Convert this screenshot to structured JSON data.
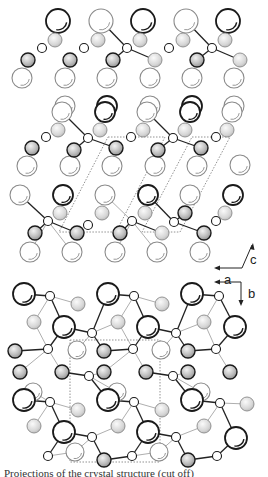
{
  "figure": {
    "caption_partial": "Projections of the crystal structure (cut off)",
    "colors": {
      "stroke_dark": "#1a1a1a",
      "stroke_light": "#8a8a8a",
      "bond_dark": "#222222",
      "bond_light": "#999999",
      "cell_dash": "#777777",
      "shade": "#bdbdbd"
    }
  },
  "axes_top": {
    "c_label": "c",
    "a_label": "a"
  },
  "axes_bottom": {
    "a_label": "a",
    "b_label": "b"
  },
  "atoms": [
    {
      "x": 58,
      "y": 21,
      "r": 12,
      "t": "Ld"
    },
    {
      "x": 101,
      "y": 21,
      "r": 12,
      "t": "Ll"
    },
    {
      "x": 143,
      "y": 21,
      "r": 12,
      "t": "Ld"
    },
    {
      "x": 186,
      "y": 21,
      "r": 12,
      "t": "Ll"
    },
    {
      "x": 228,
      "y": 21,
      "r": 12,
      "t": "Ld"
    },
    {
      "x": 55,
      "y": 40,
      "r": 7,
      "t": "Ms"
    },
    {
      "x": 98,
      "y": 40,
      "r": 7,
      "t": "Ms"
    },
    {
      "x": 140,
      "y": 40,
      "r": 7,
      "t": "Ms"
    },
    {
      "x": 183,
      "y": 40,
      "r": 7,
      "t": "Ms"
    },
    {
      "x": 225,
      "y": 40,
      "r": 7,
      "t": "Ms"
    },
    {
      "x": 42,
      "y": 48,
      "r": 4.5,
      "t": "S"
    },
    {
      "x": 84,
      "y": 48,
      "r": 4.5,
      "t": "S"
    },
    {
      "x": 127,
      "y": 48,
      "r": 4.5,
      "t": "S"
    },
    {
      "x": 169,
      "y": 48,
      "r": 4.5,
      "t": "S"
    },
    {
      "x": 212,
      "y": 48,
      "r": 4.5,
      "t": "S"
    },
    {
      "x": 28,
      "y": 60,
      "r": 7,
      "t": "Md"
    },
    {
      "x": 70,
      "y": 60,
      "r": 7,
      "t": "Md"
    },
    {
      "x": 113,
      "y": 60,
      "r": 7,
      "t": "Md"
    },
    {
      "x": 155,
      "y": 60,
      "r": 7,
      "t": "Ms"
    },
    {
      "x": 197,
      "y": 60,
      "r": 7,
      "t": "Md"
    },
    {
      "x": 240,
      "y": 60,
      "r": 7,
      "t": "Ms"
    },
    {
      "x": 22,
      "y": 78,
      "r": 10,
      "t": "Ll"
    },
    {
      "x": 65,
      "y": 78,
      "r": 10,
      "t": "Ll"
    },
    {
      "x": 107,
      "y": 78,
      "r": 10,
      "t": "Ll"
    },
    {
      "x": 150,
      "y": 78,
      "r": 10,
      "t": "Ll"
    },
    {
      "x": 192,
      "y": 78,
      "r": 10,
      "t": "Ll"
    },
    {
      "x": 234,
      "y": 78,
      "r": 10,
      "t": "Ll"
    },
    {
      "x": 65,
      "y": 106,
      "r": 10,
      "t": "Ll"
    },
    {
      "x": 107,
      "y": 106,
      "r": 10,
      "t": "Ld"
    },
    {
      "x": 150,
      "y": 106,
      "r": 10,
      "t": "Ll"
    },
    {
      "x": 192,
      "y": 106,
      "r": 10,
      "t": "Ld"
    },
    {
      "x": 234,
      "y": 106,
      "r": 10,
      "t": "Ll"
    },
    {
      "x": 62,
      "y": 112,
      "r": 10,
      "t": "Ll"
    },
    {
      "x": 105,
      "y": 112,
      "r": 10,
      "t": "Ld"
    },
    {
      "x": 147,
      "y": 112,
      "r": 10,
      "t": "Ll"
    },
    {
      "x": 190,
      "y": 112,
      "r": 10,
      "t": "Ld"
    },
    {
      "x": 232,
      "y": 112,
      "r": 10,
      "t": "Ll"
    },
    {
      "x": 58,
      "y": 130,
      "r": 7,
      "t": "Ms"
    },
    {
      "x": 100,
      "y": 130,
      "r": 7,
      "t": "Ms"
    },
    {
      "x": 143,
      "y": 130,
      "r": 7,
      "t": "Ms"
    },
    {
      "x": 185,
      "y": 130,
      "r": 7,
      "t": "Ms"
    },
    {
      "x": 227,
      "y": 130,
      "r": 7,
      "t": "Ms"
    },
    {
      "x": 46,
      "y": 137,
      "r": 4.5,
      "t": "S"
    },
    {
      "x": 88,
      "y": 138,
      "r": 4.5,
      "t": "S"
    },
    {
      "x": 131,
      "y": 137,
      "r": 4.5,
      "t": "S"
    },
    {
      "x": 173,
      "y": 138,
      "r": 4.5,
      "t": "S"
    },
    {
      "x": 216,
      "y": 137,
      "r": 4.5,
      "t": "S"
    },
    {
      "x": 32,
      "y": 148,
      "r": 7,
      "t": "Md"
    },
    {
      "x": 74,
      "y": 150,
      "r": 7,
      "t": "Md"
    },
    {
      "x": 116,
      "y": 148,
      "r": 7,
      "t": "Md"
    },
    {
      "x": 158,
      "y": 150,
      "r": 7,
      "t": "Md"
    },
    {
      "x": 201,
      "y": 148,
      "r": 7,
      "t": "Md"
    },
    {
      "x": 27,
      "y": 166,
      "r": 10,
      "t": "Ll"
    },
    {
      "x": 70,
      "y": 166,
      "r": 10,
      "t": "Ll"
    },
    {
      "x": 112,
      "y": 166,
      "r": 10,
      "t": "Ll"
    },
    {
      "x": 155,
      "y": 166,
      "r": 10,
      "t": "Ll"
    },
    {
      "x": 197,
      "y": 166,
      "r": 10,
      "t": "Ll"
    },
    {
      "x": 240,
      "y": 165,
      "r": 10,
      "t": "Ll"
    },
    {
      "x": 20,
      "y": 195,
      "r": 10,
      "t": "Ll"
    },
    {
      "x": 63,
      "y": 195,
      "r": 10,
      "t": "Ld"
    },
    {
      "x": 105,
      "y": 195,
      "r": 10,
      "t": "Ll"
    },
    {
      "x": 148,
      "y": 195,
      "r": 10,
      "t": "Ld"
    },
    {
      "x": 190,
      "y": 195,
      "r": 10,
      "t": "Ll"
    },
    {
      "x": 233,
      "y": 195,
      "r": 10,
      "t": "Ld"
    },
    {
      "x": 60,
      "y": 213,
      "r": 7,
      "t": "Ms"
    },
    {
      "x": 102,
      "y": 213,
      "r": 7,
      "t": "Ms"
    },
    {
      "x": 145,
      "y": 213,
      "r": 7,
      "t": "Ms"
    },
    {
      "x": 185,
      "y": 213,
      "r": 7,
      "t": "Md"
    },
    {
      "x": 225,
      "y": 213,
      "r": 7,
      "t": "Ms"
    },
    {
      "x": 48,
      "y": 221,
      "r": 4.5,
      "t": "S"
    },
    {
      "x": 88,
      "y": 225,
      "r": 4.5,
      "t": "S"
    },
    {
      "x": 132,
      "y": 221,
      "r": 4.5,
      "t": "S"
    },
    {
      "x": 174,
      "y": 222,
      "r": 4.5,
      "t": "S"
    },
    {
      "x": 216,
      "y": 221,
      "r": 4.5,
      "t": "S"
    },
    {
      "x": 35,
      "y": 233,
      "r": 7,
      "t": "Md"
    },
    {
      "x": 77,
      "y": 233,
      "r": 7,
      "t": "Md"
    },
    {
      "x": 120,
      "y": 233,
      "r": 7,
      "t": "Md"
    },
    {
      "x": 162,
      "y": 233,
      "r": 7,
      "t": "Ms"
    },
    {
      "x": 204,
      "y": 233,
      "r": 7,
      "t": "Md"
    },
    {
      "x": 30,
      "y": 252,
      "r": 10,
      "t": "Ll"
    },
    {
      "x": 72,
      "y": 252,
      "r": 10,
      "t": "Ll"
    },
    {
      "x": 115,
      "y": 252,
      "r": 10,
      "t": "Ll"
    },
    {
      "x": 157,
      "y": 252,
      "r": 10,
      "t": "Ll"
    },
    {
      "x": 200,
      "y": 252,
      "r": 10,
      "t": "Ll"
    },
    {
      "x": 24,
      "y": 294,
      "r": 11,
      "t": "Ld"
    },
    {
      "x": 108,
      "y": 294,
      "r": 11,
      "t": "Ld"
    },
    {
      "x": 192,
      "y": 294,
      "r": 11,
      "t": "Ld"
    },
    {
      "x": 50,
      "y": 296,
      "r": 4.5,
      "t": "S"
    },
    {
      "x": 134,
      "y": 296,
      "r": 4.5,
      "t": "S"
    },
    {
      "x": 219,
      "y": 296,
      "r": 4.5,
      "t": "S"
    },
    {
      "x": 78,
      "y": 304,
      "r": 7,
      "t": "Ms"
    },
    {
      "x": 162,
      "y": 304,
      "r": 7,
      "t": "Ms"
    },
    {
      "x": 34,
      "y": 322,
      "r": 7,
      "t": "Ms"
    },
    {
      "x": 118,
      "y": 322,
      "r": 7,
      "t": "Ms"
    },
    {
      "x": 204,
      "y": 322,
      "r": 7,
      "t": "Ms"
    },
    {
      "x": 64,
      "y": 327,
      "r": 11,
      "t": "Ld"
    },
    {
      "x": 148,
      "y": 327,
      "r": 11,
      "t": "Ld"
    },
    {
      "x": 235,
      "y": 327,
      "r": 11,
      "t": "Ld"
    },
    {
      "x": 92,
      "y": 333,
      "r": 4.5,
      "t": "S"
    },
    {
      "x": 176,
      "y": 333,
      "r": 4.5,
      "t": "S"
    },
    {
      "x": 77,
      "y": 350,
      "r": 9,
      "t": "Ll"
    },
    {
      "x": 161,
      "y": 350,
      "r": 9,
      "t": "Ll"
    },
    {
      "x": 15,
      "y": 351,
      "r": 7,
      "t": "Md"
    },
    {
      "x": 104,
      "y": 351,
      "r": 7,
      "t": "Md"
    },
    {
      "x": 188,
      "y": 351,
      "r": 7,
      "t": "Md"
    },
    {
      "x": 48,
      "y": 349,
      "r": 4.5,
      "t": "S"
    },
    {
      "x": 133,
      "y": 349,
      "r": 4.5,
      "t": "S"
    },
    {
      "x": 216,
      "y": 349,
      "r": 4.5,
      "t": "S"
    },
    {
      "x": 62,
      "y": 372,
      "r": 7,
      "t": "Md"
    },
    {
      "x": 146,
      "y": 372,
      "r": 7,
      "t": "Md"
    },
    {
      "x": 230,
      "y": 372,
      "r": 7,
      "t": "Md"
    },
    {
      "x": 20,
      "y": 372,
      "r": 7,
      "t": "Md"
    },
    {
      "x": 104,
      "y": 372,
      "r": 7,
      "t": "Md"
    },
    {
      "x": 188,
      "y": 372,
      "r": 7,
      "t": "Md"
    },
    {
      "x": 89,
      "y": 376,
      "r": 4.5,
      "t": "S"
    },
    {
      "x": 173,
      "y": 376,
      "r": 4.5,
      "t": "S"
    },
    {
      "x": 33,
      "y": 392,
      "r": 9,
      "t": "Ll"
    },
    {
      "x": 117,
      "y": 392,
      "r": 9,
      "t": "Ll"
    },
    {
      "x": 201,
      "y": 392,
      "r": 9,
      "t": "Ll"
    },
    {
      "x": 24,
      "y": 400,
      "r": 11,
      "t": "Ld"
    },
    {
      "x": 108,
      "y": 400,
      "r": 11,
      "t": "Ld"
    },
    {
      "x": 192,
      "y": 400,
      "r": 11,
      "t": "Ld"
    },
    {
      "x": 50,
      "y": 402,
      "r": 4.5,
      "t": "S"
    },
    {
      "x": 134,
      "y": 402,
      "r": 4.5,
      "t": "S"
    },
    {
      "x": 220,
      "y": 403,
      "r": 4.5,
      "t": "S"
    },
    {
      "x": 78,
      "y": 410,
      "r": 7,
      "t": "Ms"
    },
    {
      "x": 162,
      "y": 410,
      "r": 7,
      "t": "Ms"
    },
    {
      "x": 247,
      "y": 404,
      "r": 7,
      "t": "Ms"
    },
    {
      "x": 34,
      "y": 426,
      "r": 7,
      "t": "Ms"
    },
    {
      "x": 118,
      "y": 426,
      "r": 7,
      "t": "Ms"
    },
    {
      "x": 204,
      "y": 426,
      "r": 7,
      "t": "Ms"
    },
    {
      "x": 64,
      "y": 432,
      "r": 11,
      "t": "Ld"
    },
    {
      "x": 148,
      "y": 432,
      "r": 11,
      "t": "Ld"
    },
    {
      "x": 236,
      "y": 438,
      "r": 11,
      "t": "Ld"
    },
    {
      "x": 92,
      "y": 437,
      "r": 4.5,
      "t": "S"
    },
    {
      "x": 176,
      "y": 437,
      "r": 4.5,
      "t": "S"
    },
    {
      "x": 75,
      "y": 452,
      "r": 9,
      "t": "Ll"
    },
    {
      "x": 159,
      "y": 452,
      "r": 9,
      "t": "Ll"
    },
    {
      "x": 48,
      "y": 456,
      "r": 4.5,
      "t": "S"
    },
    {
      "x": 132,
      "y": 456,
      "r": 4.5,
      "t": "S"
    },
    {
      "x": 217,
      "y": 456,
      "r": 4.5,
      "t": "S"
    },
    {
      "x": 104,
      "y": 460,
      "r": 7,
      "t": "Md"
    },
    {
      "x": 188,
      "y": 460,
      "r": 7,
      "t": "Md"
    }
  ],
  "bonds": [
    [
      101,
      21,
      127,
      48,
      "d"
    ],
    [
      127,
      48,
      155,
      60,
      "d"
    ],
    [
      127,
      48,
      113,
      60,
      "d"
    ],
    [
      186,
      21,
      212,
      48,
      "d"
    ],
    [
      212,
      48,
      240,
      60,
      "d"
    ],
    [
      212,
      48,
      197,
      60,
      "d"
    ],
    [
      62,
      112,
      88,
      138,
      "d"
    ],
    [
      88,
      138,
      116,
      148,
      "d"
    ],
    [
      88,
      138,
      74,
      150,
      "d"
    ],
    [
      147,
      112,
      173,
      138,
      "d"
    ],
    [
      173,
      138,
      201,
      148,
      "d"
    ],
    [
      173,
      138,
      158,
      150,
      "d"
    ],
    [
      20,
      195,
      48,
      221,
      "d"
    ],
    [
      48,
      221,
      35,
      233,
      "d"
    ],
    [
      48,
      221,
      77,
      233,
      "d"
    ],
    [
      48,
      221,
      30,
      252,
      "l"
    ],
    [
      48,
      221,
      72,
      252,
      "l"
    ],
    [
      105,
      195,
      132,
      221,
      "l"
    ],
    [
      132,
      221,
      120,
      233,
      "d"
    ],
    [
      132,
      221,
      162,
      233,
      "d"
    ],
    [
      132,
      221,
      115,
      252,
      "l"
    ],
    [
      132,
      221,
      157,
      252,
      "l"
    ],
    [
      148,
      195,
      174,
      222,
      "d"
    ],
    [
      174,
      222,
      185,
      213,
      "d"
    ],
    [
      174,
      222,
      204,
      233,
      "d"
    ],
    [
      24,
      294,
      50,
      296,
      "d"
    ],
    [
      50,
      296,
      78,
      304,
      "l"
    ],
    [
      50,
      296,
      64,
      327,
      "d"
    ],
    [
      50,
      296,
      34,
      322,
      "l"
    ],
    [
      108,
      294,
      134,
      296,
      "d"
    ],
    [
      134,
      296,
      162,
      304,
      "l"
    ],
    [
      134,
      296,
      148,
      327,
      "d"
    ],
    [
      134,
      296,
      118,
      322,
      "l"
    ],
    [
      192,
      294,
      219,
      296,
      "d"
    ],
    [
      219,
      296,
      235,
      327,
      "d"
    ],
    [
      219,
      296,
      204,
      322,
      "l"
    ],
    [
      64,
      327,
      92,
      333,
      "d"
    ],
    [
      92,
      333,
      118,
      322,
      "l"
    ],
    [
      92,
      333,
      77,
      350,
      "l"
    ],
    [
      92,
      333,
      104,
      351,
      "d"
    ],
    [
      108,
      294,
      92,
      333,
      "d"
    ],
    [
      148,
      327,
      176,
      333,
      "d"
    ],
    [
      176,
      333,
      204,
      322,
      "l"
    ],
    [
      176,
      333,
      161,
      350,
      "l"
    ],
    [
      176,
      333,
      188,
      351,
      "d"
    ],
    [
      192,
      294,
      176,
      333,
      "d"
    ],
    [
      15,
      351,
      48,
      349,
      "d"
    ],
    [
      48,
      349,
      34,
      322,
      "l"
    ],
    [
      48,
      349,
      64,
      327,
      "d"
    ],
    [
      48,
      349,
      62,
      372,
      "l"
    ],
    [
      48,
      349,
      20,
      372,
      "l"
    ],
    [
      104,
      351,
      133,
      349,
      "d"
    ],
    [
      133,
      349,
      118,
      322,
      "l"
    ],
    [
      133,
      349,
      148,
      327,
      "d"
    ],
    [
      133,
      349,
      146,
      372,
      "l"
    ],
    [
      133,
      349,
      104,
      372,
      "l"
    ],
    [
      188,
      351,
      216,
      349,
      "d"
    ],
    [
      216,
      349,
      204,
      322,
      "l"
    ],
    [
      216,
      349,
      235,
      327,
      "d"
    ],
    [
      216,
      349,
      230,
      372,
      "l"
    ],
    [
      62,
      372,
      89,
      376,
      "d"
    ],
    [
      89,
      376,
      117,
      392,
      "l"
    ],
    [
      89,
      376,
      108,
      400,
      "d"
    ],
    [
      89,
      376,
      104,
      372,
      "l"
    ],
    [
      146,
      372,
      173,
      376,
      "d"
    ],
    [
      173,
      376,
      201,
      392,
      "l"
    ],
    [
      173,
      376,
      192,
      400,
      "d"
    ],
    [
      173,
      376,
      188,
      372,
      "l"
    ],
    [
      24,
      400,
      50,
      402,
      "d"
    ],
    [
      50,
      402,
      78,
      410,
      "l"
    ],
    [
      50,
      402,
      64,
      432,
      "d"
    ],
    [
      50,
      402,
      34,
      426,
      "l"
    ],
    [
      50,
      402,
      33,
      392,
      "l"
    ],
    [
      108,
      400,
      134,
      402,
      "d"
    ],
    [
      134,
      402,
      162,
      410,
      "l"
    ],
    [
      134,
      402,
      148,
      432,
      "d"
    ],
    [
      134,
      402,
      118,
      426,
      "l"
    ],
    [
      192,
      400,
      220,
      403,
      "d"
    ],
    [
      220,
      403,
      247,
      404,
      "l"
    ],
    [
      220,
      403,
      236,
      438,
      "d"
    ],
    [
      220,
      403,
      204,
      426,
      "l"
    ],
    [
      64,
      432,
      92,
      437,
      "d"
    ],
    [
      92,
      437,
      118,
      426,
      "l"
    ],
    [
      92,
      437,
      104,
      460,
      "d"
    ],
    [
      92,
      437,
      75,
      452,
      "l"
    ],
    [
      148,
      432,
      176,
      437,
      "d"
    ],
    [
      176,
      437,
      204,
      426,
      "l"
    ],
    [
      176,
      437,
      188,
      460,
      "d"
    ],
    [
      176,
      437,
      159,
      452,
      "l"
    ],
    [
      48,
      456,
      75,
      452,
      "l"
    ],
    [
      48,
      456,
      64,
      432,
      "d"
    ],
    [
      132,
      456,
      159,
      452,
      "l"
    ],
    [
      132,
      456,
      148,
      432,
      "d"
    ],
    [
      132,
      456,
      104,
      460,
      "d"
    ],
    [
      217,
      456,
      236,
      438,
      "d"
    ],
    [
      217,
      456,
      188,
      460,
      "d"
    ]
  ],
  "unit_cells": [
    {
      "points": "108,137 165,137 116,232 59,232",
      "label": "cell-top-1"
    },
    {
      "points": "192,137 230,137 180,232 142,232",
      "label": "cell-top-2"
    },
    {
      "points": "70,340 160,340 160,462 70,462",
      "label": "cell-bottom"
    }
  ]
}
